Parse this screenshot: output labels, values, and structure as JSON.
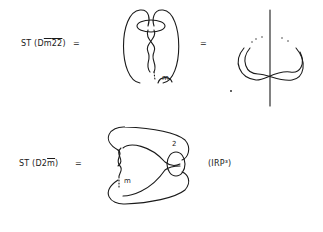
{
  "row1": {
    "label_prefix": "ST (D",
    "label_m": "m",
    "label_22": "22",
    "label_suffix": ")",
    "eq1": "=",
    "eq2": "=",
    "knot_label": "m"
  },
  "row2": {
    "label_prefix": "ST (D2",
    "label_m": "m",
    "label_suffix": ")",
    "eq": "=",
    "knot_label_m": "m",
    "knot_label_2": "2",
    "space": "(IRP³)"
  }
}
